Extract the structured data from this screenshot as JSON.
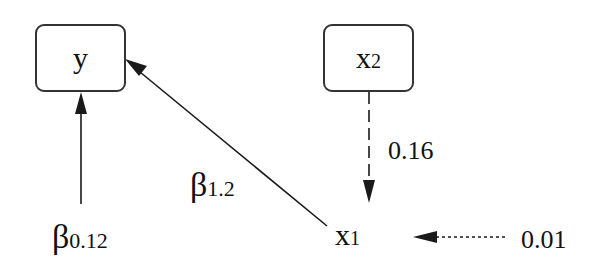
{
  "nodes": {
    "y": {
      "label": "y"
    },
    "x2": {
      "label": "x",
      "sub": "2"
    },
    "x1": {
      "label": "x",
      "sub": "1"
    }
  },
  "edges": [
    {
      "from": "constant",
      "to": "y",
      "style": "solid",
      "label_symbol": "β",
      "label_sub": "0.12"
    },
    {
      "from": "x1",
      "to": "y",
      "style": "solid",
      "label_symbol": "β",
      "label_sub": "1.2"
    },
    {
      "from": "x2",
      "to": "x1",
      "style": "dashed",
      "label": "0.16"
    },
    {
      "from": "error",
      "to": "x1",
      "style": "dotted",
      "label": "0.01"
    }
  ],
  "colors": {
    "line": "#1a1a1a",
    "box_border": "#333333",
    "background": "#ffffff"
  }
}
